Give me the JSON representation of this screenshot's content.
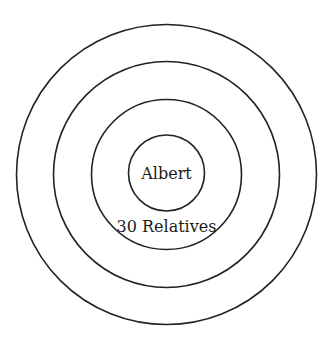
{
  "diagram": {
    "type": "concentric-circles",
    "center": {
      "x": 166.5,
      "y": 174
    },
    "stroke_color": "#222222",
    "rings": [
      {
        "name": "outer",
        "r": 150
      },
      {
        "name": "second",
        "r": 113
      },
      {
        "name": "third",
        "r": 75
      },
      {
        "name": "inner",
        "r": 38
      }
    ],
    "center_label": "Albert",
    "ring_label": "30 Relatives"
  }
}
